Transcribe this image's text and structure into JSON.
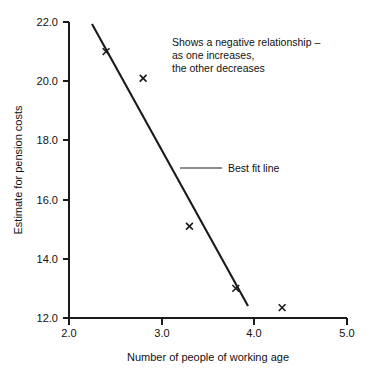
{
  "chart_data": {
    "type": "scatter",
    "title": "",
    "xlabel": "Number of people of working age",
    "ylabel": "Estimate for pension costs",
    "xlim": [
      2.0,
      5.0
    ],
    "ylim": [
      12.0,
      22.0
    ],
    "xticks": [
      "2.0",
      "3.0",
      "4.0",
      "5.0"
    ],
    "xtick_values": [
      2.0,
      3.0,
      4.0,
      5.0
    ],
    "yticks": [
      "12.0",
      "14.0",
      "16.0",
      "18.0",
      "20.0",
      "22.0"
    ],
    "ytick_values": [
      12.0,
      14.0,
      16.0,
      18.0,
      20.0,
      22.0
    ],
    "grid": false,
    "legend": "none",
    "marker": "x",
    "points": [
      {
        "x": 2.4,
        "y": 21.0
      },
      {
        "x": 2.8,
        "y": 20.1
      },
      {
        "x": 3.3,
        "y": 15.1
      },
      {
        "x": 3.8,
        "y": 13.0
      },
      {
        "x": 4.3,
        "y": 12.35
      }
    ],
    "series": [
      {
        "name": "Best fit line",
        "type": "line",
        "x": [
          2.25,
          4.0
        ],
        "values": [
          21.8,
          12.4
        ]
      }
    ],
    "annotations": [
      {
        "name": "relationship-note",
        "lines": [
          "Shows a negative relationship –",
          "as one increases,",
          "the other decreases"
        ]
      },
      {
        "name": "best-fit-callout",
        "text": "Best fit line"
      }
    ]
  },
  "axes": {
    "x_title": "Number of people of working age",
    "y_title": "Estimate for pension costs",
    "x_tick_labels": [
      "2.0",
      "3.0",
      "4.0",
      "5.0"
    ],
    "y_tick_labels": [
      "22.0",
      "20.0",
      "18.0",
      "16.0",
      "14.0",
      "12.0"
    ]
  },
  "annotation": {
    "line1": "Shows a negative relationship –",
    "line2": "as one increases,",
    "line3": "the other decreases"
  },
  "callout": {
    "best_fit_label": "Best fit line"
  },
  "colors": {
    "ink": "#1a1a1a",
    "leader": "#8d8d8d",
    "background": "#ffffff"
  }
}
